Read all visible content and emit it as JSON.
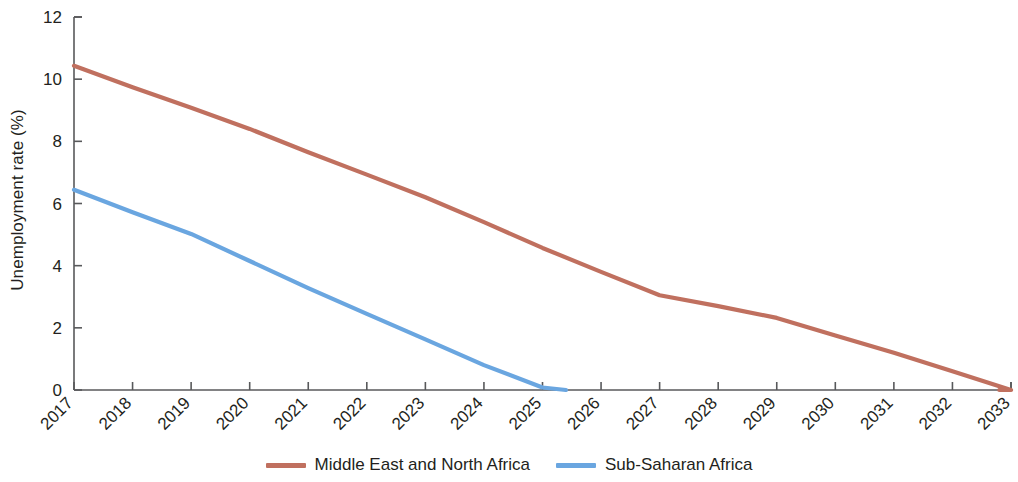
{
  "chart_data": {
    "type": "line",
    "title": "",
    "subtitle": "",
    "xlabel": "",
    "ylabel": "Unemployment rate (%)",
    "xlim": [
      2017,
      2033
    ],
    "ylim": [
      0,
      12
    ],
    "grid": false,
    "legend_position": "bottom",
    "x": [
      2017,
      2018,
      2019,
      2020,
      2021,
      2022,
      2023,
      2024,
      2025,
      2026,
      2027,
      2028,
      2029,
      2030,
      2031,
      2032,
      2033
    ],
    "xticklabels": [
      "2017",
      "2018",
      "2019",
      "2020",
      "2021",
      "2022",
      "2023",
      "2024",
      "2025",
      "2026",
      "2027",
      "2028",
      "2029",
      "2030",
      "2031",
      "2032",
      "2033"
    ],
    "yticks": [
      0,
      2,
      4,
      6,
      8,
      10,
      12
    ],
    "yticklabels": [
      "0",
      "2",
      "4",
      "6",
      "8",
      "10",
      "12"
    ],
    "series": [
      {
        "name": "Middle East and North Africa",
        "color": "#c0705f",
        "values": [
          10.43,
          9.74,
          9.08,
          8.4,
          7.65,
          6.93,
          6.2,
          5.4,
          4.57,
          3.8,
          3.05,
          2.7,
          2.32,
          1.75,
          1.2,
          0.6,
          0.0
        ],
        "ends_at_zero_x": 2032.8
      },
      {
        "name": "Sub-Saharan Africa",
        "color": "#6aa6e0",
        "values": [
          6.44,
          5.72,
          5.02,
          4.15,
          3.28,
          2.45,
          1.63,
          0.8,
          0.08,
          null,
          null,
          null,
          null,
          null,
          null,
          null,
          null
        ],
        "ends_at_zero_x": 2025.4
      }
    ]
  },
  "axis": {
    "y_axis_title": "Unemployment rate (%)"
  },
  "legend": {
    "entries": [
      {
        "label": "Middle East and North Africa",
        "color": "#c0705f"
      },
      {
        "label": "Sub-Saharan Africa",
        "color": "#6aa6e0"
      }
    ]
  }
}
